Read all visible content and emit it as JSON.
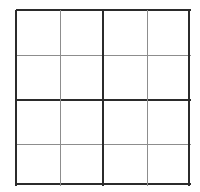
{
  "canvas": {
    "width": 200,
    "height": 192,
    "background": "#ffffff"
  },
  "grid": {
    "kind": "sudoku-grid",
    "size": 4,
    "block_rows": 2,
    "block_cols": 2,
    "bounds": {
      "left": 16,
      "top": 10,
      "right": 191,
      "bottom": 186
    },
    "cell_width": 43.75,
    "cell_height": 44,
    "colors": {
      "background": "#ffffff",
      "thick_line": "#2b2b2b",
      "thin_line": "#8d8d8d",
      "text": "#1a1a1a"
    },
    "line_weights": {
      "thick": 2,
      "thin": 1
    },
    "vertical_rules": [
      {
        "x": 16,
        "weight": "thick",
        "role": "outer-left"
      },
      {
        "x": 60,
        "weight": "thin",
        "role": "cell"
      },
      {
        "x": 103,
        "weight": "thick",
        "role": "block"
      },
      {
        "x": 147,
        "weight": "thin",
        "role": "cell"
      },
      {
        "x": 189,
        "weight": "thick",
        "role": "outer-right"
      }
    ],
    "horizontal_rules": [
      {
        "y": 10,
        "weight": "thick",
        "role": "outer-top"
      },
      {
        "y": 55,
        "weight": "thin",
        "role": "cell"
      },
      {
        "y": 100,
        "weight": "thick",
        "role": "block"
      },
      {
        "y": 144,
        "weight": "thin",
        "role": "cell"
      },
      {
        "y": 184,
        "weight": "thick",
        "role": "outer-bottom"
      }
    ],
    "rows": [
      {
        "cells": [
          {
            "value": ""
          },
          {
            "value": ""
          },
          {
            "value": ""
          },
          {
            "value": ""
          }
        ]
      },
      {
        "cells": [
          {
            "value": ""
          },
          {
            "value": ""
          },
          {
            "value": ""
          },
          {
            "value": ""
          }
        ]
      },
      {
        "cells": [
          {
            "value": ""
          },
          {
            "value": ""
          },
          {
            "value": ""
          },
          {
            "value": ""
          }
        ]
      },
      {
        "cells": [
          {
            "value": ""
          },
          {
            "value": ""
          },
          {
            "value": ""
          },
          {
            "value": ""
          }
        ]
      }
    ]
  }
}
